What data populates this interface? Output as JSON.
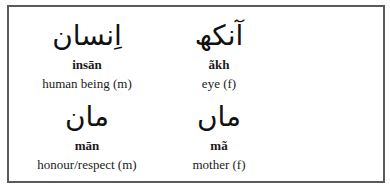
{
  "vocabulary": [
    {
      "urdu": "اِنسان",
      "transliteration": "insān",
      "meaning": "human being (m)"
    },
    {
      "urdu": "آنکھ",
      "transliteration": "ãkh",
      "meaning": "eye (f)"
    },
    {
      "urdu": "مان",
      "transliteration": "mān",
      "meaning": "honour/respect (m)"
    },
    {
      "urdu": "ماں",
      "transliteration": "mã",
      "meaning": "mother (f)"
    }
  ]
}
